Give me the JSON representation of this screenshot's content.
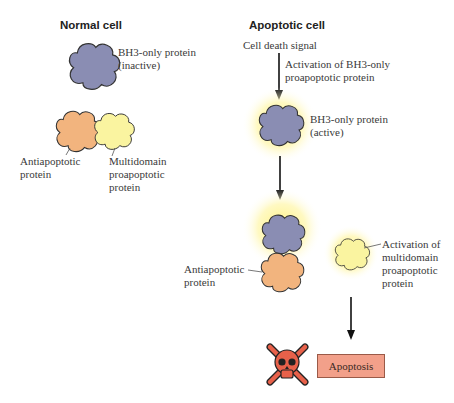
{
  "left_panel": {
    "title": "Normal cell",
    "bh3_label_line1": "BH3-only protein",
    "bh3_label_line2": "(inactive)",
    "anti_label_line1": "Antiapoptotic",
    "anti_label_line2": "protein",
    "multi_label_line1": "Multidomain",
    "multi_label_line2": "proapoptotic",
    "multi_label_line3": "protein"
  },
  "right_panel": {
    "title": "Apoptotic cell",
    "signal": "Cell death signal",
    "activation_line1": "Activation of BH3-only",
    "activation_line2": "proapoptotic protein",
    "bh3_active_line1": "BH3-only protein",
    "bh3_active_line2": "(active)",
    "anti_label_line1": "Antiapoptotic",
    "anti_label_line2": "protein",
    "multi_act_line1": "Activation of",
    "multi_act_line2": "multidomain",
    "multi_act_line3": "proapoptotic",
    "multi_act_line4": "protein",
    "outcome": "Apoptosis"
  },
  "colors": {
    "bh3": "#8a8db3",
    "anti": "#f2b47e",
    "multi": "#faf4a0",
    "glow": "#fff27a",
    "box": "#f2a08a",
    "skull": "#e8614a"
  }
}
